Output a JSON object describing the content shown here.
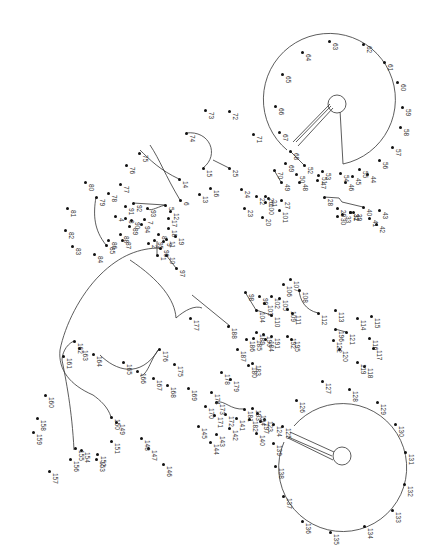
{
  "style": {
    "line_color": "#333333",
    "dot_color": "#111111",
    "label_color": "#333333"
  },
  "dots": [
    {
      "n": "1",
      "x": 157,
      "y": 255
    },
    {
      "n": "2",
      "x": 148,
      "y": 243
    },
    {
      "n": "3",
      "x": 125,
      "y": 218
    },
    {
      "n": "4",
      "x": 115,
      "y": 216
    },
    {
      "n": "5",
      "x": 165,
      "y": 205
    },
    {
      "n": "6",
      "x": 180,
      "y": 200
    },
    {
      "n": "7",
      "x": 144,
      "y": 219
    },
    {
      "n": "8",
      "x": 158,
      "y": 234
    },
    {
      "n": "9",
      "x": 163,
      "y": 241
    },
    {
      "n": "10",
      "x": 166,
      "y": 255
    },
    {
      "n": "11",
      "x": 166,
      "y": 239
    },
    {
      "n": "12",
      "x": 170,
      "y": 211
    },
    {
      "n": "13",
      "x": 199,
      "y": 194
    },
    {
      "n": "14",
      "x": 179,
      "y": 179
    },
    {
      "n": "15",
      "x": 203,
      "y": 168
    },
    {
      "n": "16",
      "x": 210,
      "y": 188
    },
    {
      "n": "17",
      "x": 168,
      "y": 218
    },
    {
      "n": "18",
      "x": 168,
      "y": 228
    },
    {
      "n": "19",
      "x": 175,
      "y": 236
    },
    {
      "n": "20",
      "x": 262,
      "y": 217
    },
    {
      "n": "21",
      "x": 268,
      "y": 198
    },
    {
      "n": "22",
      "x": 256,
      "y": 196
    },
    {
      "n": "23",
      "x": 244,
      "y": 208
    },
    {
      "n": "24",
      "x": 241,
      "y": 189
    },
    {
      "n": "25",
      "x": 229,
      "y": 168
    },
    {
      "n": "26",
      "x": 265,
      "y": 196
    },
    {
      "n": "27",
      "x": 281,
      "y": 200
    },
    {
      "n": "28",
      "x": 324,
      "y": 197
    },
    {
      "n": "29",
      "x": 337,
      "y": 208
    },
    {
      "n": "30",
      "x": 337,
      "y": 216
    },
    {
      "n": "31",
      "x": 350,
      "y": 212
    },
    {
      "n": "32",
      "x": 350,
      "y": 212
    },
    {
      "n": "33",
      "x": 342,
      "y": 214
    },
    {
      "n": "39",
      "x": 353,
      "y": 212
    },
    {
      "n": "40",
      "x": 363,
      "y": 207
    },
    {
      "n": "41",
      "x": 369,
      "y": 218
    },
    {
      "n": "42",
      "x": 376,
      "y": 224
    },
    {
      "n": "43",
      "x": 379,
      "y": 210
    },
    {
      "n": "44",
      "x": 367,
      "y": 174
    },
    {
      "n": "45",
      "x": 352,
      "y": 176
    },
    {
      "n": "46",
      "x": 345,
      "y": 182
    },
    {
      "n": "47",
      "x": 317,
      "y": 180
    },
    {
      "n": "48",
      "x": 299,
      "y": 182
    },
    {
      "n": "49",
      "x": 281,
      "y": 182
    },
    {
      "n": "50",
      "x": 296,
      "y": 174
    },
    {
      "n": "51",
      "x": 318,
      "y": 175
    },
    {
      "n": "52",
      "x": 304,
      "y": 165
    },
    {
      "n": "53",
      "x": 322,
      "y": 171
    },
    {
      "n": "54",
      "x": 340,
      "y": 173
    },
    {
      "n": "55",
      "x": 359,
      "y": 169
    },
    {
      "n": "56",
      "x": 379,
      "y": 160
    },
    {
      "n": "57",
      "x": 392,
      "y": 147
    },
    {
      "n": "58",
      "x": 400,
      "y": 127
    },
    {
      "n": "59",
      "x": 402,
      "y": 107
    },
    {
      "n": "60",
      "x": 397,
      "y": 82
    },
    {
      "n": "61",
      "x": 384,
      "y": 62
    },
    {
      "n": "62",
      "x": 363,
      "y": 44
    },
    {
      "n": "63",
      "x": 329,
      "y": 41
    },
    {
      "n": "64",
      "x": 302,
      "y": 52
    },
    {
      "n": "65",
      "x": 282,
      "y": 74
    },
    {
      "n": "66",
      "x": 275,
      "y": 106
    },
    {
      "n": "67",
      "x": 279,
      "y": 132
    },
    {
      "n": "68",
      "x": 290,
      "y": 151
    },
    {
      "n": "69",
      "x": 285,
      "y": 163
    },
    {
      "n": "70",
      "x": 274,
      "y": 170
    },
    {
      "n": "71",
      "x": 253,
      "y": 134
    },
    {
      "n": "72",
      "x": 229,
      "y": 111
    },
    {
      "n": "73",
      "x": 205,
      "y": 110
    },
    {
      "n": "74",
      "x": 186,
      "y": 133
    },
    {
      "n": "75",
      "x": 139,
      "y": 153
    },
    {
      "n": "76",
      "x": 126,
      "y": 165
    },
    {
      "n": "77",
      "x": 120,
      "y": 184
    },
    {
      "n": "78",
      "x": 108,
      "y": 193
    },
    {
      "n": "79",
      "x": 96,
      "y": 197
    },
    {
      "n": "80",
      "x": 85,
      "y": 182
    },
    {
      "n": "81",
      "x": 67,
      "y": 208
    },
    {
      "n": "82",
      "x": 65,
      "y": 230
    },
    {
      "n": "83",
      "x": 72,
      "y": 246
    },
    {
      "n": "84",
      "x": 94,
      "y": 254
    },
    {
      "n": "85",
      "x": 106,
      "y": 245
    },
    {
      "n": "86",
      "x": 108,
      "y": 240
    },
    {
      "n": "87",
      "x": 122,
      "y": 240
    },
    {
      "n": "88",
      "x": 120,
      "y": 234
    },
    {
      "n": "89",
      "x": 129,
      "y": 226
    },
    {
      "n": "90",
      "x": 131,
      "y": 220
    },
    {
      "n": "91",
      "x": 125,
      "y": 206
    },
    {
      "n": "92",
      "x": 133,
      "y": 203
    },
    {
      "n": "93",
      "x": 147,
      "y": 208
    },
    {
      "n": "94",
      "x": 141,
      "y": 224
    },
    {
      "n": "95",
      "x": 154,
      "y": 240
    },
    {
      "n": "96",
      "x": 160,
      "y": 248
    },
    {
      "n": "97",
      "x": 176,
      "y": 268
    },
    {
      "n": "98",
      "x": 245,
      "y": 292
    },
    {
      "n": "99",
      "x": 259,
      "y": 296
    },
    {
      "n": "100",
      "x": 265,
      "y": 202
    },
    {
      "n": "101",
      "x": 279,
      "y": 210
    },
    {
      "n": "102",
      "x": 271,
      "y": 296
    },
    {
      "n": "103",
      "x": 264,
      "y": 303
    },
    {
      "n": "104",
      "x": 256,
      "y": 310
    },
    {
      "n": "105",
      "x": 279,
      "y": 298
    },
    {
      "n": "106",
      "x": 283,
      "y": 284
    },
    {
      "n": "107",
      "x": 290,
      "y": 279
    },
    {
      "n": "108",
      "x": 299,
      "y": 290
    },
    {
      "n": "109",
      "x": 287,
      "y": 309
    },
    {
      "n": "110",
      "x": 271,
      "y": 315
    },
    {
      "n": "111",
      "x": 292,
      "y": 313
    },
    {
      "n": "112",
      "x": 318,
      "y": 313
    },
    {
      "n": "113",
      "x": 335,
      "y": 310
    },
    {
      "n": "114",
      "x": 357,
      "y": 318
    },
    {
      "n": "115",
      "x": 371,
      "y": 316
    },
    {
      "n": "116",
      "x": 369,
      "y": 338
    },
    {
      "n": "117",
      "x": 373,
      "y": 348
    },
    {
      "n": "118",
      "x": 364,
      "y": 366
    },
    {
      "n": "119",
      "x": 357,
      "y": 362
    },
    {
      "n": "120",
      "x": 339,
      "y": 349
    },
    {
      "n": "121",
      "x": 346,
      "y": 332
    },
    {
      "n": "122",
      "x": 333,
      "y": 340
    },
    {
      "n": "123",
      "x": 264,
      "y": 419
    },
    {
      "n": "124",
      "x": 273,
      "y": 424
    },
    {
      "n": "125",
      "x": 282,
      "y": 426
    },
    {
      "n": "126",
      "x": 296,
      "y": 400
    },
    {
      "n": "127",
      "x": 322,
      "y": 381
    },
    {
      "n": "128",
      "x": 349,
      "y": 389
    },
    {
      "n": "129",
      "x": 377,
      "y": 402
    },
    {
      "n": "130",
      "x": 395,
      "y": 424
    },
    {
      "n": "131",
      "x": 405,
      "y": 452
    },
    {
      "n": "132",
      "x": 404,
      "y": 484
    },
    {
      "n": "133",
      "x": 392,
      "y": 510
    },
    {
      "n": "134",
      "x": 364,
      "y": 526
    },
    {
      "n": "135",
      "x": 330,
      "y": 532
    },
    {
      "n": "136",
      "x": 302,
      "y": 521
    },
    {
      "n": "137",
      "x": 283,
      "y": 496
    },
    {
      "n": "138",
      "x": 275,
      "y": 466
    },
    {
      "n": "139",
      "x": 273,
      "y": 443
    },
    {
      "n": "140",
      "x": 256,
      "y": 433
    },
    {
      "n": "141",
      "x": 236,
      "y": 418
    },
    {
      "n": "142",
      "x": 229,
      "y": 428
    },
    {
      "n": "143",
      "x": 216,
      "y": 434
    },
    {
      "n": "144",
      "x": 210,
      "y": 442
    },
    {
      "n": "145",
      "x": 198,
      "y": 426
    },
    {
      "n": "146",
      "x": 163,
      "y": 464
    },
    {
      "n": "147",
      "x": 148,
      "y": 448
    },
    {
      "n": "148",
      "x": 141,
      "y": 438
    },
    {
      "n": "149",
      "x": 116,
      "y": 422
    },
    {
      "n": "150",
      "x": 111,
      "y": 417
    },
    {
      "n": "151",
      "x": 111,
      "y": 441
    },
    {
      "n": "152",
      "x": 97,
      "y": 454
    },
    {
      "n": "153",
      "x": 96,
      "y": 459
    },
    {
      "n": "154",
      "x": 81,
      "y": 450
    },
    {
      "n": "155",
      "x": 75,
      "y": 448
    },
    {
      "n": "156",
      "x": 70,
      "y": 459
    },
    {
      "n": "157",
      "x": 49,
      "y": 471
    },
    {
      "n": "158",
      "x": 37,
      "y": 418
    },
    {
      "n": "159",
      "x": 33,
      "y": 432
    },
    {
      "n": "160",
      "x": 45,
      "y": 395
    },
    {
      "n": "161",
      "x": 63,
      "y": 356
    },
    {
      "n": "162",
      "x": 74,
      "y": 341
    },
    {
      "n": "163",
      "x": 79,
      "y": 348
    },
    {
      "n": "164",
      "x": 93,
      "y": 354
    },
    {
      "n": "165",
      "x": 123,
      "y": 362
    },
    {
      "n": "166",
      "x": 137,
      "y": 371
    },
    {
      "n": "167",
      "x": 153,
      "y": 378
    },
    {
      "n": "168",
      "x": 167,
      "y": 385
    },
    {
      "n": "169",
      "x": 188,
      "y": 388
    },
    {
      "n": "170",
      "x": 205,
      "y": 406
    },
    {
      "n": "171",
      "x": 214,
      "y": 415
    },
    {
      "n": "172",
      "x": 225,
      "y": 414
    },
    {
      "n": "173",
      "x": 216,
      "y": 402
    },
    {
      "n": "174",
      "x": 211,
      "y": 392
    },
    {
      "n": "175",
      "x": 174,
      "y": 364
    },
    {
      "n": "176",
      "x": 159,
      "y": 349
    },
    {
      "n": "177",
      "x": 190,
      "y": 318
    },
    {
      "n": "178",
      "x": 221,
      "y": 372
    },
    {
      "n": "179",
      "x": 230,
      "y": 379
    },
    {
      "n": "180",
      "x": 248,
      "y": 365
    },
    {
      "n": "181",
      "x": 244,
      "y": 409
    },
    {
      "n": "182",
      "x": 249,
      "y": 419
    },
    {
      "n": "183",
      "x": 252,
      "y": 363
    },
    {
      "n": "184",
      "x": 265,
      "y": 339
    },
    {
      "n": "185",
      "x": 253,
      "y": 338
    },
    {
      "n": "186",
      "x": 246,
      "y": 339
    },
    {
      "n": "187",
      "x": 237,
      "y": 349
    },
    {
      "n": "188",
      "x": 228,
      "y": 326
    },
    {
      "n": "189",
      "x": 256,
      "y": 332
    },
    {
      "n": "190",
      "x": 263,
      "y": 334
    },
    {
      "n": "191",
      "x": 271,
      "y": 336
    },
    {
      "n": "192",
      "x": 287,
      "y": 336
    },
    {
      "n": "193",
      "x": 252,
      "y": 408
    },
    {
      "n": "194",
      "x": 257,
      "y": 413
    },
    {
      "n": "195",
      "x": 291,
      "y": 339
    },
    {
      "n": "196",
      "x": 335,
      "y": 329
    },
    {
      "n": "197",
      "x": 260,
      "y": 421
    }
  ]
}
